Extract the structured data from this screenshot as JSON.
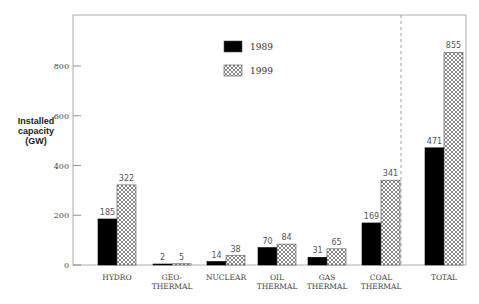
{
  "chart_data": {
    "type": "bar",
    "title": "",
    "xlabel": "",
    "ylabel": "Installed capacity (GW)",
    "ylabel_lines": [
      "Installed",
      "capacity",
      "(GW)"
    ],
    "ylim": [
      0,
      1000
    ],
    "yticks": [
      0,
      200,
      400,
      600,
      800
    ],
    "grid": false,
    "legend_position": "upper center",
    "categories": [
      "HYDRO",
      "GEO-THERMAL",
      "NUCLEAR",
      "OIL THERMAL",
      "GAS THERMAL",
      "COAL THERMAL",
      "TOTAL"
    ],
    "category_labels": [
      [
        "HYDRO"
      ],
      [
        "GEO-",
        "THERMAL"
      ],
      [
        "NUCLEAR"
      ],
      [
        "OIL",
        "THERMAL"
      ],
      [
        "GAS",
        "THERMAL"
      ],
      [
        "COAL",
        "THERMAL"
      ],
      [
        "TOTAL"
      ]
    ],
    "series": [
      {
        "name": "1989",
        "style": "solid",
        "color": "#000000",
        "values": [
          185,
          2,
          14,
          70,
          31,
          169,
          471
        ]
      },
      {
        "name": "1999",
        "style": "crosshatch",
        "color": "#ffffff",
        "values": [
          322,
          5,
          38,
          84,
          65,
          341,
          855
        ]
      }
    ],
    "annotations": [
      "dashed vertical separator before TOTAL"
    ]
  }
}
